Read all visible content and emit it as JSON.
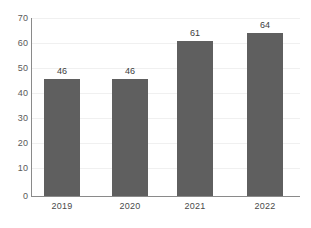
{
  "chart_data": {
    "type": "bar",
    "title": "",
    "subtitle": "",
    "xlabel": "",
    "ylabel": "",
    "categories": [
      "2019",
      "2020",
      "2021",
      "2022"
    ],
    "values": [
      46,
      46,
      61,
      64
    ],
    "data_labels": [
      "46",
      "46",
      "61",
      "64"
    ],
    "ylim": [
      0,
      70
    ],
    "ytick_step": 10,
    "ytick_labels": [
      "70",
      "60",
      "50",
      "40",
      "30",
      "20",
      "10",
      "0"
    ],
    "ytick_values": [
      70,
      60,
      50,
      40,
      30,
      20,
      10,
      0
    ],
    "grid": true,
    "grid_axis": "y",
    "legend": false,
    "legend_position": "none",
    "series": [
      {
        "name": "",
        "values": [
          46,
          46,
          61,
          64
        ]
      }
    ]
  },
  "style": {
    "bar_color": "#5f5f5f",
    "background_color": "#ffffff",
    "axis_color": "#8a8a8a",
    "gridline_color": "#f0f0f0",
    "tick_label_color": "#595959",
    "value_label_color": "#3d3d3d",
    "category_label_color": "#4a4a4a"
  }
}
